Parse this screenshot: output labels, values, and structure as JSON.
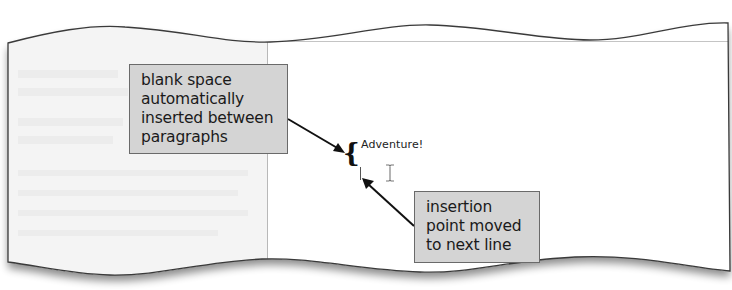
{
  "figure": {
    "type": "annotated-document-screenshot",
    "document": {
      "heading_text": "Adventure!",
      "insertion_point": "blinking caret on next line",
      "mouse_pointer": "i-beam"
    },
    "callouts": [
      {
        "id": "blank-space",
        "lines": [
          "blank space",
          "automatically",
          "inserted between",
          "paragraphs"
        ],
        "points_to": "brace between paragraphs"
      },
      {
        "id": "insertion-point",
        "lines": [
          "insertion",
          "point moved",
          "to next line"
        ],
        "points_to": "insertion point caret"
      }
    ],
    "colors": {
      "callout_fill": "#d4d4d4",
      "callout_border": "#6a6a6a",
      "left_panel": "#f4f4f4",
      "page": "#ffffff",
      "outline": "#3a3a3a"
    }
  }
}
